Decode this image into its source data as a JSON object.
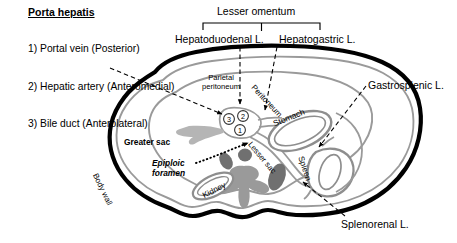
{
  "figure": {
    "colors": {
      "body_wall": "#000000",
      "peritoneum_line": "#9a9a9a",
      "organ_gray": "#6f6f6f",
      "liver_gray": "#b5b5b5",
      "background": "#ffffff"
    }
  },
  "legend": {
    "heading": "Porta hepatis",
    "items": [
      "1) Portal vein (Posterior)",
      "2) Hepatic artery (Anteromedial)",
      "3) Bile duct (Anterolateral)"
    ]
  },
  "callouts": {
    "lesser_omentum": "Lesser omentum",
    "hepatoduodenal": "Hepatoduodenal L.",
    "hepatogastric": "Hepatogastric L.",
    "gastrosplenic": "Gastrosplenic L.",
    "splenorenal": "Splenorenal L."
  },
  "inner_labels": {
    "parietal_peritoneum": "Parietal\nperitoneum",
    "peritoneum": "Peritoneum",
    "greater_sac": "Greater sac",
    "lesser_sac": "Lesser sac",
    "epiploic_foramen": "Epiploic\nforamen",
    "stomach": "Stomach",
    "spleen": "Spleen",
    "kidney": "Kidney",
    "body_wall": "Body wall"
  },
  "porta_hepatis_markers": [
    {
      "id": "3",
      "x": 229,
      "y": 119
    },
    {
      "id": "2",
      "x": 243,
      "y": 116
    },
    {
      "id": "1",
      "x": 240,
      "y": 130
    }
  ]
}
